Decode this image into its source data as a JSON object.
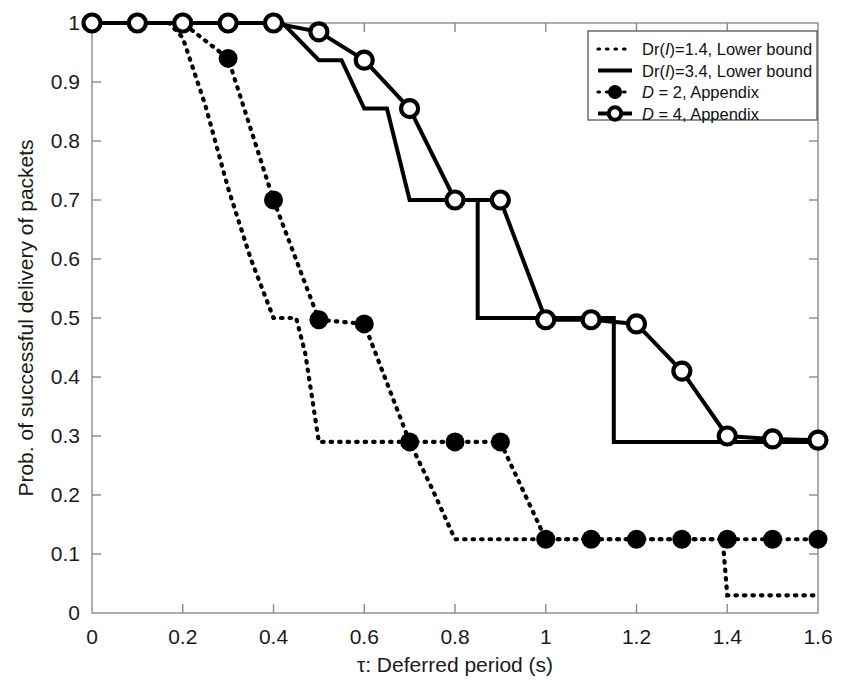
{
  "chart_data": {
    "type": "line",
    "title": "",
    "xlabel": "τ: Deferred period (s)",
    "ylabel": "Prob. of successful delivery of packets",
    "xlim": [
      0,
      1.6
    ],
    "ylim": [
      0,
      1
    ],
    "xticks": [
      "0",
      "0.2",
      "0.4",
      "0.6",
      "0.8",
      "1",
      "1.2",
      "1.4",
      "1.6"
    ],
    "xtick_values": [
      0,
      0.2,
      0.4,
      0.6,
      0.8,
      1.0,
      1.2,
      1.4,
      1.6
    ],
    "yticks": [
      "0",
      "0.1",
      "0.2",
      "0.3",
      "0.4",
      "0.5",
      "0.6",
      "0.7",
      "0.8",
      "0.9",
      "1"
    ],
    "ytick_values": [
      0,
      0.1,
      0.2,
      0.3,
      0.4,
      0.5,
      0.6,
      0.7,
      0.8,
      0.9,
      1.0
    ],
    "grid": false,
    "legend_position": "top-right",
    "series": [
      {
        "name": "Dr(I)=1.4, Lower bound",
        "style": "dotted",
        "marker": "none",
        "color": "#000000",
        "points": [
          [
            0.0,
            1.0
          ],
          [
            0.17,
            1.0
          ],
          [
            0.2,
            0.975
          ],
          [
            0.25,
            0.86
          ],
          [
            0.3,
            0.72
          ],
          [
            0.35,
            0.6
          ],
          [
            0.4,
            0.5
          ],
          [
            0.45,
            0.5
          ],
          [
            0.47,
            0.44
          ],
          [
            0.5,
            0.29
          ],
          [
            0.55,
            0.29
          ],
          [
            0.6,
            0.29
          ],
          [
            0.65,
            0.29
          ],
          [
            0.7,
            0.29
          ],
          [
            0.75,
            0.21
          ],
          [
            0.8,
            0.125
          ],
          [
            1.0,
            0.125
          ],
          [
            1.2,
            0.125
          ],
          [
            1.39,
            0.125
          ],
          [
            1.4,
            0.03
          ],
          [
            1.6,
            0.03
          ]
        ]
      },
      {
        "name": "Dr(I)=3.4, Lower bound",
        "style": "solid",
        "marker": "none",
        "color": "#000000",
        "points": [
          [
            0.0,
            1.0
          ],
          [
            0.42,
            1.0
          ],
          [
            0.5,
            0.937
          ],
          [
            0.55,
            0.937
          ],
          [
            0.6,
            0.855
          ],
          [
            0.65,
            0.855
          ],
          [
            0.7,
            0.7
          ],
          [
            0.85,
            0.7
          ],
          [
            0.85,
            0.5
          ],
          [
            1.15,
            0.5
          ],
          [
            1.15,
            0.29
          ],
          [
            1.6,
            0.29
          ]
        ]
      },
      {
        "name": "D = 2, Appendix",
        "style": "dotted",
        "marker": "filled-circle",
        "color": "#000000",
        "points": [
          [
            0.0,
            1.0
          ],
          [
            0.1,
            1.0
          ],
          [
            0.2,
            1.0
          ],
          [
            0.3,
            0.94
          ],
          [
            0.4,
            0.7
          ],
          [
            0.5,
            0.497
          ],
          [
            0.6,
            0.49
          ],
          [
            0.7,
            0.29
          ],
          [
            0.8,
            0.29
          ],
          [
            0.9,
            0.29
          ],
          [
            1.0,
            0.125
          ],
          [
            1.1,
            0.125
          ],
          [
            1.2,
            0.125
          ],
          [
            1.3,
            0.125
          ],
          [
            1.4,
            0.125
          ],
          [
            1.5,
            0.125
          ],
          [
            1.6,
            0.125
          ]
        ]
      },
      {
        "name": "D = 4, Appendix",
        "style": "solid",
        "marker": "open-circle",
        "color": "#000000",
        "points": [
          [
            0.0,
            1.0
          ],
          [
            0.1,
            1.0
          ],
          [
            0.2,
            1.0
          ],
          [
            0.3,
            1.0
          ],
          [
            0.4,
            1.0
          ],
          [
            0.5,
            0.985
          ],
          [
            0.6,
            0.937
          ],
          [
            0.7,
            0.855
          ],
          [
            0.8,
            0.7
          ],
          [
            0.9,
            0.7
          ],
          [
            1.0,
            0.497
          ],
          [
            1.1,
            0.497
          ],
          [
            1.2,
            0.49
          ],
          [
            1.3,
            0.41
          ],
          [
            1.4,
            0.3
          ],
          [
            1.5,
            0.295
          ],
          [
            1.6,
            0.293
          ]
        ]
      }
    ]
  },
  "legend": {
    "entries": [
      {
        "label_pre": "Dr(",
        "label_ital": "I",
        "label_post": ")=1.4, Lower bound",
        "swatch": "dotted-line"
      },
      {
        "label_pre": "Dr(",
        "label_ital": "I",
        "label_post": ")=3.4, Lower bound",
        "swatch": "solid-line"
      },
      {
        "label_pre": "",
        "label_ital": "D",
        "label_post": " = 2, Appendix",
        "swatch": "dotted-filled-circle"
      },
      {
        "label_pre": "",
        "label_ital": "D",
        "label_post": " = 4, Appendix",
        "swatch": "solid-open-circle"
      }
    ]
  },
  "colors": {
    "line": "#000000",
    "axis": "#7a7a7a",
    "text": "#1a1a1a",
    "background": "#ffffff"
  }
}
